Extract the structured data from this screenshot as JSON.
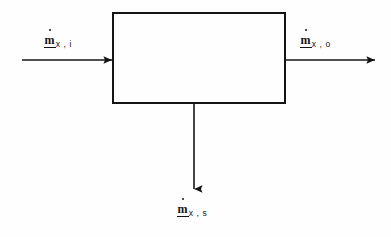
{
  "diagram": {
    "type": "block-flow-diagram",
    "background_color": "#fefefe",
    "line_color": "#141414",
    "system_box": {
      "name": "control-volume",
      "label": "",
      "x": 113,
      "y": 13,
      "width": 172,
      "height": 90,
      "stroke_width": 2,
      "fill": "none"
    },
    "flows": [
      {
        "id": "inlet",
        "direction": "right",
        "symbol": "m",
        "accent": "dot",
        "underline": true,
        "subscript": "x , i",
        "label_text": "ṁx , i",
        "from_x": 22,
        "to_x": 113,
        "y": 60
      },
      {
        "id": "outlet",
        "direction": "right",
        "symbol": "m",
        "accent": "dot",
        "underline": true,
        "subscript": "x , o",
        "label_text": "ṁx , o",
        "from_x": 285,
        "to_x": 376,
        "y": 60
      },
      {
        "id": "sink",
        "direction": "down",
        "symbol": "m",
        "accent": "dot",
        "underline": true,
        "subscript": "x , s",
        "label_text": "ṁx , s",
        "x": 194,
        "from_y": 103,
        "to_y": 190
      }
    ]
  }
}
